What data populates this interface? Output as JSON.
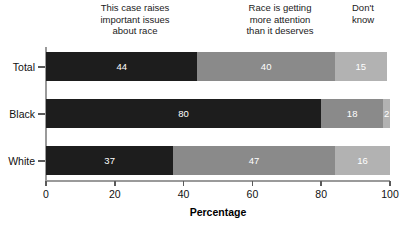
{
  "chart_data": {
    "type": "bar",
    "orientation": "horizontal",
    "stacked": true,
    "stack_mode": "percent",
    "title": "",
    "subtitle": "",
    "xlabel": "Percentage",
    "ylabel": "",
    "xlim": [
      0,
      100
    ],
    "xticks": [
      0,
      20,
      40,
      60,
      80,
      100
    ],
    "xticklabels": [
      "0",
      "20",
      "40",
      "60",
      "80",
      "100"
    ],
    "grid": false,
    "legend_position": "top-as-column-headers",
    "categories": [
      "Total",
      "Black",
      "White"
    ],
    "series": [
      {
        "name": "This case raises important issues about race",
        "color": "#1d1d1d",
        "values": [
          44,
          80,
          37
        ]
      },
      {
        "name": "Race is getting more attention than it deserves",
        "color": "#8a8a8a",
        "values": [
          40,
          18,
          47
        ]
      },
      {
        "name": "Don't know",
        "color": "#b2b2b2",
        "values": [
          15,
          2,
          16
        ]
      }
    ],
    "data_label_color": "#ffffff",
    "rows": [
      {
        "category": "Total",
        "segments": [
          {
            "value": 44,
            "label": "44",
            "series": "This case raises important issues about race"
          },
          {
            "value": 40,
            "label": "40",
            "series": "Race is getting more attention than it deserves"
          },
          {
            "value": 15,
            "label": "15",
            "series": "Don't know"
          }
        ]
      },
      {
        "category": "Black",
        "segments": [
          {
            "value": 80,
            "label": "80",
            "series": "This case raises important issues about race"
          },
          {
            "value": 18,
            "label": "18",
            "series": "Race is getting more attention than it deserves"
          },
          {
            "value": 2,
            "label": "2",
            "series": "Don't know"
          }
        ]
      },
      {
        "category": "White",
        "segments": [
          {
            "value": 37,
            "label": "37",
            "series": "This case raises important issues about race"
          },
          {
            "value": 47,
            "label": "47",
            "series": "Race is getting more attention than it deserves"
          },
          {
            "value": 16,
            "label": "16",
            "series": "Don't know"
          }
        ]
      }
    ]
  },
  "column_headers": [
    {
      "line1": "This case raises",
      "line2": "important issues",
      "line3": "about race"
    },
    {
      "line1": "Race is getting",
      "line2": "more attention",
      "line3": "than it deserves"
    },
    {
      "line1": "Don't",
      "line2": "know",
      "line3": ""
    }
  ]
}
